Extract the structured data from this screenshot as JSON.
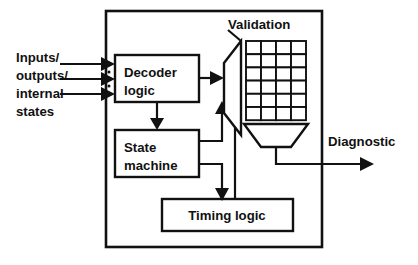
{
  "diagram": {
    "background_color": "#ffffff",
    "line_color": "#111111",
    "outer_boundary": {
      "name": "system-boundary",
      "x": 106,
      "y": 11,
      "width": 216,
      "height": 236
    },
    "input_label": {
      "lines": [
        "Inputs/",
        "outputs/",
        "internal",
        "states"
      ],
      "line1": "Inputs/",
      "line2": "outputs/",
      "line3": "internal",
      "line4": "states"
    },
    "output_label": {
      "text": "Diagnostic"
    },
    "validation_label": {
      "text": "Validation"
    },
    "blocks": [
      {
        "id": "decoder-logic",
        "line1": "Decoder",
        "line2": "logic",
        "x": 115,
        "y": 55,
        "width": 84,
        "height": 47
      },
      {
        "id": "state-machine",
        "line1": "State",
        "line2": "machine",
        "x": 115,
        "y": 130,
        "width": 84,
        "height": 47
      },
      {
        "id": "timing-logic",
        "line1": "Timing logic",
        "line2": "",
        "x": 162,
        "y": 199,
        "width": 131,
        "height": 32
      }
    ],
    "validation_unit": {
      "shape": "mux-trapezoid",
      "grid_columns": 4,
      "grid_rows": 6,
      "funnel": "trapezoid-down"
    },
    "input_arrow_count": 3,
    "ellipsis_dots": 2
  }
}
